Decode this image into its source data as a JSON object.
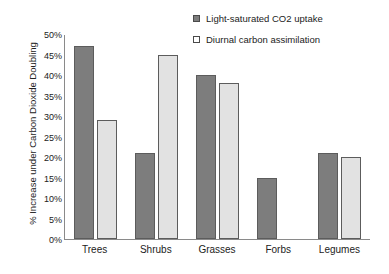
{
  "chart_data": {
    "type": "bar",
    "title": "",
    "xlabel": "",
    "ylabel": "% Increase under  Carbon Dioxide Doubling",
    "ylim": [
      0,
      50
    ],
    "ytick_labels": [
      "50%",
      "45%",
      "40%",
      "35%",
      "30%",
      "25%",
      "20%",
      "15%",
      "10%",
      "5%",
      "0%"
    ],
    "ytick_values": [
      50,
      45,
      40,
      35,
      30,
      25,
      20,
      15,
      10,
      5,
      0
    ],
    "grid": false,
    "legend_position": "top-right",
    "categories": [
      "Trees",
      "Shrubs",
      "Grasses",
      "Forbs",
      "Legumes"
    ],
    "series": [
      {
        "name": "Light-saturated CO2 uptake",
        "color": "#7d7d7d",
        "values": [
          47,
          21,
          40,
          15,
          21
        ]
      },
      {
        "name": "Diurnal carbon assimilation",
        "color": "#e2e2e2",
        "values": [
          29,
          45,
          38,
          null,
          20
        ]
      }
    ]
  },
  "legend": {
    "entries": [
      {
        "label": "Light-saturated CO2 uptake"
      },
      {
        "label": "Diurnal carbon assimilation"
      }
    ]
  }
}
